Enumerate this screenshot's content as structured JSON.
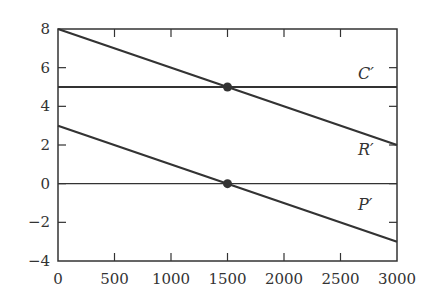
{
  "chart_data": {
    "type": "line",
    "title": "",
    "xlabel": "",
    "ylabel": "",
    "xlim": [
      0,
      3000
    ],
    "ylim": [
      -4,
      8
    ],
    "grid": false,
    "x_ticks": [
      0,
      500,
      1000,
      1500,
      2000,
      2500,
      3000
    ],
    "x_tick_labels": [
      "0",
      "500",
      "1000",
      "1500",
      "2000",
      "2500",
      "3000"
    ],
    "y_ticks": [
      -4,
      -2,
      0,
      2,
      4,
      6,
      8
    ],
    "y_tick_labels": [
      "−4",
      "−2",
      "0",
      "2",
      "4",
      "6",
      "8"
    ],
    "series": [
      {
        "name": "C′",
        "x": [
          0,
          3000
        ],
        "values": [
          5,
          5
        ]
      },
      {
        "name": "R′",
        "x": [
          0,
          3000
        ],
        "values": [
          8,
          2
        ]
      },
      {
        "name": "P′",
        "x": [
          0,
          3000
        ],
        "values": [
          3,
          -3
        ]
      },
      {
        "name": "zero",
        "x": [
          0,
          3000
        ],
        "values": [
          0,
          0
        ]
      }
    ],
    "points": [
      {
        "x": 1500,
        "y": 5
      },
      {
        "x": 1500,
        "y": 0
      }
    ],
    "annotations": [
      {
        "text": "C′",
        "x": 2680,
        "y": 5.9
      },
      {
        "text": "R′",
        "x": 2680,
        "y": 2.6
      },
      {
        "text": "P′",
        "x": 2680,
        "y": -1.5
      }
    ]
  },
  "labels": {
    "c": "C′",
    "r": "R′",
    "p": "P′"
  }
}
